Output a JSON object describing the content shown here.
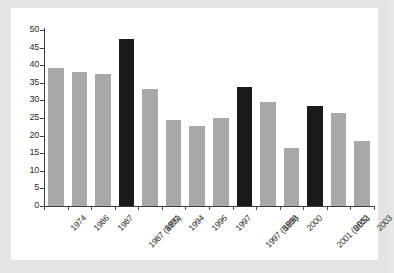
{
  "chart_data": {
    "type": "bar",
    "title": "",
    "subtitle": "",
    "xlabel": "",
    "ylabel": "",
    "ylim": [
      0,
      50
    ],
    "yticks": [
      0,
      5,
      10,
      15,
      20,
      25,
      30,
      35,
      40,
      45,
      50
    ],
    "grid": false,
    "legend": "none",
    "categories": [
      "1974",
      "1986",
      "1987",
      "1987 (BES)",
      "1991",
      "1994",
      "1996",
      "1997",
      "1997 (BES)",
      "1998",
      "2000",
      "2001 (BES)",
      "2002",
      "2003"
    ],
    "values": [
      39.2,
      38.1,
      37.4,
      47.5,
      33.2,
      24.4,
      22.6,
      25.1,
      33.7,
      29.5,
      16.4,
      28.3,
      26.3,
      18.6
    ],
    "bar_colors": [
      "#a8a8a8",
      "#a8a8a8",
      "#a8a8a8",
      "#1a1a1a",
      "#a8a8a8",
      "#a8a8a8",
      "#a8a8a8",
      "#a8a8a8",
      "#1a1a1a",
      "#a8a8a8",
      "#a8a8a8",
      "#1a1a1a",
      "#a8a8a8",
      "#a8a8a8"
    ],
    "highlight_color": "#1a1a1a",
    "default_color": "#a8a8a8",
    "panel_background": "#ffffff",
    "figure_background": "#e4e4e4",
    "axis_color": "#3c3c3c"
  }
}
